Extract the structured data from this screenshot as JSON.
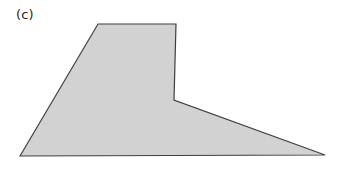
{
  "figure": {
    "panel_label": "(c)",
    "background_color": "#ffffff",
    "shape": {
      "name": "irregular-hexagon-ramp",
      "fill_color": "#d2d2d2",
      "stroke_color": "#3f3f3f",
      "stroke_width": 1.2,
      "vertices": [
        [
          20,
          156
        ],
        [
          98,
          24
        ],
        [
          176,
          24
        ],
        [
          174,
          100
        ],
        [
          325,
          155
        ]
      ],
      "points_attr": "20,156 98,24 176,24 174,100 325,155",
      "view_box": "0 0 345 177"
    }
  }
}
